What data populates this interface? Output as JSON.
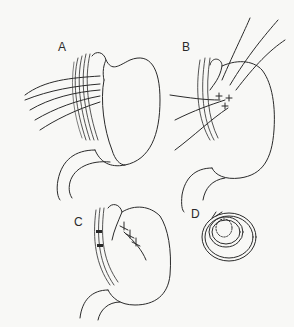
{
  "figure": {
    "panels": [
      {
        "id": "A",
        "label": "A",
        "description": "Stomach fundus passed behind esophagus with sutures placed"
      },
      {
        "id": "B",
        "label": "B",
        "description": "Fundic wrap with sutures being tied"
      },
      {
        "id": "C",
        "label": "C",
        "description": "Completed fundoplication wrap"
      },
      {
        "id": "D",
        "label": "D",
        "description": "Cross-section of wrap around esophagus"
      }
    ],
    "colors": {
      "ink": "#2a2a2a",
      "background": "#f8f8f6"
    }
  }
}
